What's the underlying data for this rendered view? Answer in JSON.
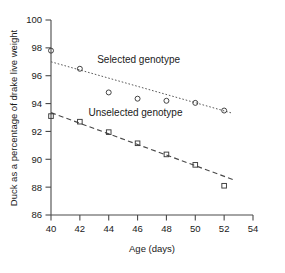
{
  "chart_data": {
    "type": "scatter",
    "title": "",
    "xlabel": "Age (days)",
    "ylabel": "Duck as a percentage of drake live weight",
    "xlim": [
      40,
      54
    ],
    "ylim": [
      86,
      100
    ],
    "xticks": [
      40,
      42,
      44,
      46,
      48,
      50,
      52,
      54
    ],
    "yticks": [
      86,
      88,
      90,
      92,
      94,
      96,
      98,
      100
    ],
    "xtick_labels": [
      "40",
      "42",
      "44",
      "46",
      "48",
      "50",
      "52",
      "54"
    ],
    "ytick_labels": [
      "86",
      "88",
      "90",
      "92",
      "94",
      "96",
      "98",
      "100"
    ],
    "grid": false,
    "legend_position": "inline-annotation",
    "series": [
      {
        "name": "Selected genotype",
        "marker": "circle",
        "line_style": "dotted",
        "x": [
          40,
          42,
          44,
          46,
          48,
          50,
          52
        ],
        "values": [
          97.8,
          96.5,
          94.8,
          94.35,
          94.2,
          94.05,
          93.5
        ],
        "trend_line": {
          "x_start": 40,
          "y_start": 97.0,
          "x_end": 52.6,
          "y_end": 93.3
        },
        "annotation": {
          "text": "Selected genotype",
          "x": 43.2,
          "y": 96.9
        }
      },
      {
        "name": "Unselected genotype",
        "marker": "square",
        "line_style": "dashed",
        "x": [
          40,
          42,
          44,
          46,
          48,
          50,
          52
        ],
        "values": [
          93.1,
          92.7,
          91.95,
          91.15,
          90.35,
          89.6,
          88.1
        ],
        "trend_line": {
          "x_start": 40,
          "y_start": 93.35,
          "x_end": 52.6,
          "y_end": 88.55
        },
        "annotation": {
          "text": "Unselected genotype",
          "x": 42.6,
          "y": 93.1
        }
      }
    ]
  },
  "axes": {
    "x_axis_title": "Age (days)",
    "y_axis_title": "Duck as a percentage of drake live weight"
  },
  "colors": {
    "axis": "#4a4a4a",
    "marker": "#3a3a3a",
    "text": "#1a1a1a",
    "background": "#ffffff"
  }
}
